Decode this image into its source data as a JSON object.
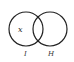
{
  "diagram": {
    "type": "venn",
    "sets": [
      {
        "label": "I",
        "cx": 26,
        "cy": 29,
        "r": 17
      },
      {
        "label": "H",
        "cx": 50,
        "cy": 29,
        "r": 17
      }
    ],
    "element_label": "x",
    "stroke_color": "#222222"
  }
}
